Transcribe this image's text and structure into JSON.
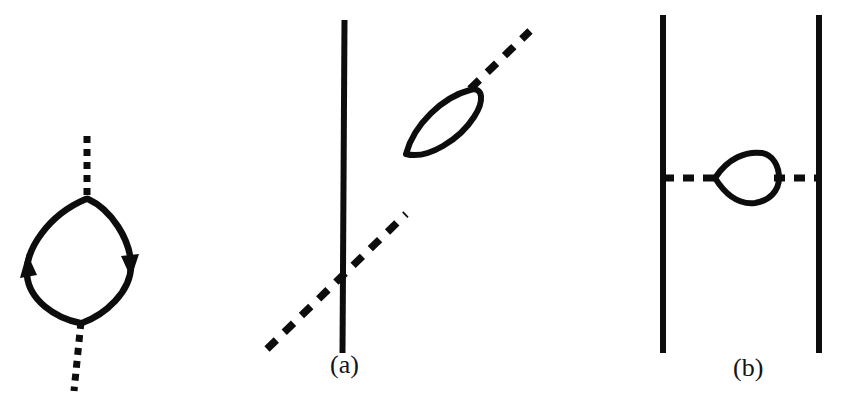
{
  "figure": {
    "kind": "feynman-diagram-figure",
    "background_color": "#ffffff",
    "ink_color": "#0d0d0d",
    "width": 849,
    "height": 404,
    "panels": [
      {
        "id": "panel-0",
        "label": "",
        "description": "self-energy bubble: vertical dashed line broken by a closed fermion loop with two arrows",
        "elements": [
          {
            "name": "dashed-line-top",
            "type": "dashed-line",
            "x1": 87,
            "y1": 136,
            "x2": 87,
            "y2": 198
          },
          {
            "name": "dashed-line-bottom",
            "type": "dashed-line",
            "x1": 80,
            "y1": 322,
            "x2": 74,
            "y2": 390
          },
          {
            "name": "fermion-loop-left-arc",
            "type": "arc",
            "direction": "upward"
          },
          {
            "name": "fermion-loop-right-arc",
            "type": "arc",
            "direction": "downward"
          },
          {
            "name": "arrow-left",
            "type": "arrowhead",
            "x": 30,
            "y": 268,
            "direction": "up"
          },
          {
            "name": "arrow-right",
            "type": "arrowhead",
            "x": 124,
            "y": 258,
            "direction": "down"
          }
        ]
      },
      {
        "id": "panel-a",
        "label": "(a)",
        "description": "vertical solid line crossed by a diagonal dashed line carrying a lens-shaped loop insertion",
        "elements": [
          {
            "name": "solid-vertical-line",
            "type": "solid-line",
            "x1": 344,
            "y1": 20,
            "x2": 342,
            "y2": 352
          },
          {
            "name": "dashed-diagonal-lower",
            "type": "dashed-line",
            "x1": 268,
            "y1": 348,
            "x2": 405,
            "y2": 215
          },
          {
            "name": "dashed-diagonal-upper",
            "type": "dashed-line",
            "x1": 472,
            "y1": 86,
            "x2": 528,
            "y2": 32
          },
          {
            "name": "loop-insertion",
            "type": "lens-loop",
            "tilt": "45deg"
          }
        ]
      },
      {
        "id": "panel-b",
        "label": "(b)",
        "description": "two parallel vertical solid lines joined by a horizontal dashed line carrying a lens-shaped loop insertion",
        "elements": [
          {
            "name": "solid-vertical-line-left",
            "type": "solid-line",
            "x1": 662,
            "y1": 15,
            "x2": 662,
            "y2": 352
          },
          {
            "name": "solid-vertical-line-right",
            "type": "solid-line",
            "x1": 819,
            "y1": 15,
            "x2": 819,
            "y2": 352
          },
          {
            "name": "dashed-horizontal-left",
            "type": "dashed-line",
            "x1": 662,
            "y1": 178,
            "x2": 714,
            "y2": 178
          },
          {
            "name": "dashed-horizontal-right",
            "type": "dashed-line",
            "x1": 775,
            "y1": 178,
            "x2": 819,
            "y2": 178
          },
          {
            "name": "loop-insertion",
            "type": "lens-loop",
            "tilt": "0deg"
          }
        ]
      }
    ]
  },
  "labels": {
    "panel_a": "(a)",
    "panel_b": "(b)"
  }
}
